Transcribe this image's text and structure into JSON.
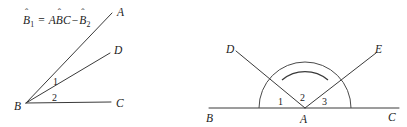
{
  "figure": {
    "background_color": "#ffffff",
    "line_color": "#3a3a3a",
    "text_color": "#222222",
    "width": 407,
    "height": 127
  },
  "left_panel": {
    "formula": {
      "full_text": "B̂1 = AB̂C − B̂2",
      "lhs_base": "B",
      "lhs_hat": "ˆ",
      "lhs_subscript": "1",
      "equals": "=",
      "rhs_first_letter": "A",
      "rhs_mid_base": "B",
      "rhs_mid_hat": "ˆ",
      "rhs_last_letter": "C",
      "minus": "−",
      "rhs_term_base": "B",
      "rhs_term_hat": "ˆ",
      "rhs_term_subscript": "2"
    },
    "points": [
      {
        "label": "A",
        "x": 117,
        "y": 12
      },
      {
        "label": "D",
        "x": 114,
        "y": 50
      },
      {
        "label": "B",
        "x": 16,
        "y": 107
      },
      {
        "label": "C",
        "x": 116,
        "y": 104
      }
    ],
    "vertex": {
      "label": "B",
      "x": 26,
      "y": 103
    },
    "rays": [
      {
        "name": "ray-BA",
        "to_label": "A",
        "x1": 26,
        "y1": 103,
        "x2": 112,
        "y2": 13
      },
      {
        "name": "ray-BD",
        "to_label": "D",
        "x1": 26,
        "y1": 103,
        "x2": 110,
        "y2": 53
      },
      {
        "name": "ray-BC",
        "to_label": "C",
        "x1": 26,
        "y1": 103,
        "x2": 111,
        "y2": 102
      }
    ],
    "angle_labels": [
      {
        "label": "1",
        "x": 55,
        "y": 81,
        "between": "BA and BD"
      },
      {
        "label": "2",
        "x": 54,
        "y": 98,
        "between": "BD and BC"
      }
    ]
  },
  "right_panel": {
    "points": [
      {
        "label": "D",
        "x": 228,
        "y": 49
      },
      {
        "label": "E",
        "x": 374,
        "y": 50
      },
      {
        "label": "B",
        "x": 209,
        "y": 119
      },
      {
        "label": "A",
        "x": 300,
        "y": 121
      },
      {
        "label": "C",
        "x": 389,
        "y": 118
      }
    ],
    "vertex": {
      "label": "A",
      "x": 305,
      "y": 108
    },
    "baseline": {
      "name": "line-BC",
      "x1": 209,
      "y1": 108,
      "x2": 399,
      "y2": 108
    },
    "rays": [
      {
        "name": "ray-AD",
        "to_label": "D",
        "x1": 305,
        "y1": 108,
        "x2": 237,
        "y2": 52
      },
      {
        "name": "ray-AE",
        "to_label": "E",
        "x1": 305,
        "y1": 108,
        "x2": 375,
        "y2": 54
      }
    ],
    "arcs": [
      {
        "name": "outer-arc",
        "radius": 45,
        "spans": "angle BAC"
      },
      {
        "name": "inner-arc",
        "radius": 36,
        "spans": "angle DAE"
      }
    ],
    "angle_labels": [
      {
        "label": "1",
        "x": 281,
        "y": 103,
        "between": "AB and AD"
      },
      {
        "label": "2",
        "x": 302,
        "y": 100,
        "between": "AD and AE"
      },
      {
        "label": "3",
        "x": 324,
        "y": 103,
        "between": "AE and AC"
      }
    ]
  }
}
